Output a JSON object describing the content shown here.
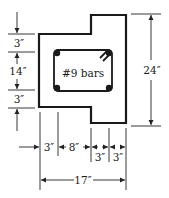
{
  "diagram": {
    "bar_label": "#9 bars",
    "left_dimensions": [
      {
        "label": "3″",
        "from_y": 34,
        "to_y": 52
      },
      {
        "label": "14″",
        "from_y": 52,
        "to_y": 90
      },
      {
        "label": "3″",
        "from_y": 90,
        "to_y": 108
      }
    ],
    "right_dimension": {
      "label": "24″"
    },
    "bottom_dimensions": [
      {
        "label": "3″"
      },
      {
        "label": "8″"
      },
      {
        "label": "3″"
      },
      {
        "label": "3″"
      }
    ],
    "overall_width": {
      "label": "17″"
    },
    "colors": {
      "line": "#1a1a1a",
      "background": "#ffffff"
    }
  }
}
